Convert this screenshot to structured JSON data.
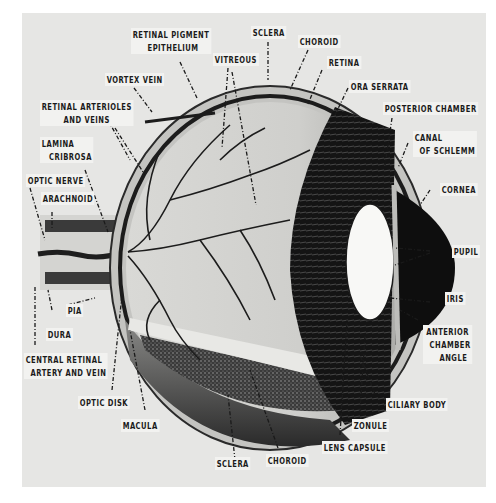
{
  "figure": {
    "colors": {
      "page": "#ffffff",
      "panel": "#e6e6e4",
      "ink": "#1a1a1a",
      "label_bg": "#f2f2f0"
    }
  },
  "labels": {
    "retinal_pigment_epithelium": [
      "RETINAL PIGMENT",
      "EPITHELIUM"
    ],
    "sclera_top": "SCLERA",
    "choroid_top": "CHOROID",
    "vitreous": "VITREOUS",
    "retina": "RETINA",
    "vortex_vein": "VORTEX VEIN",
    "ora_serrata": "ORA SERRATA",
    "retinal_arterioles": [
      "RETINAL ARTERIOLES",
      "AND VEINS"
    ],
    "posterior_chamber": "POSTERIOR CHAMBER",
    "lamina_cribrosa": [
      "LAMINA",
      "CRIBROSA"
    ],
    "canal_of_schlemm": [
      "CANAL",
      "OF SCHLEMM"
    ],
    "optic_nerve": "OPTIC NERVE",
    "arachnoid": "ARACHNOID",
    "cornea": "CORNEA",
    "pupil": "PUPIL",
    "pia": "PIA",
    "dura": "DURA",
    "iris": "IRIS",
    "anterior_chamber_angle": [
      "ANTERIOR",
      "CHAMBER",
      "ANGLE"
    ],
    "central_retinal": [
      "CENTRAL RETINAL",
      "ARTERY AND VEIN"
    ],
    "optic_disk": "OPTIC DISK",
    "ciliary_body": "CILIARY BODY",
    "macula": "MACULA",
    "zonule": "ZONULE",
    "lens_capsule": "LENS CAPSULE",
    "sclera_bottom": "SCLERA",
    "choroid_bottom": "CHOROID"
  }
}
